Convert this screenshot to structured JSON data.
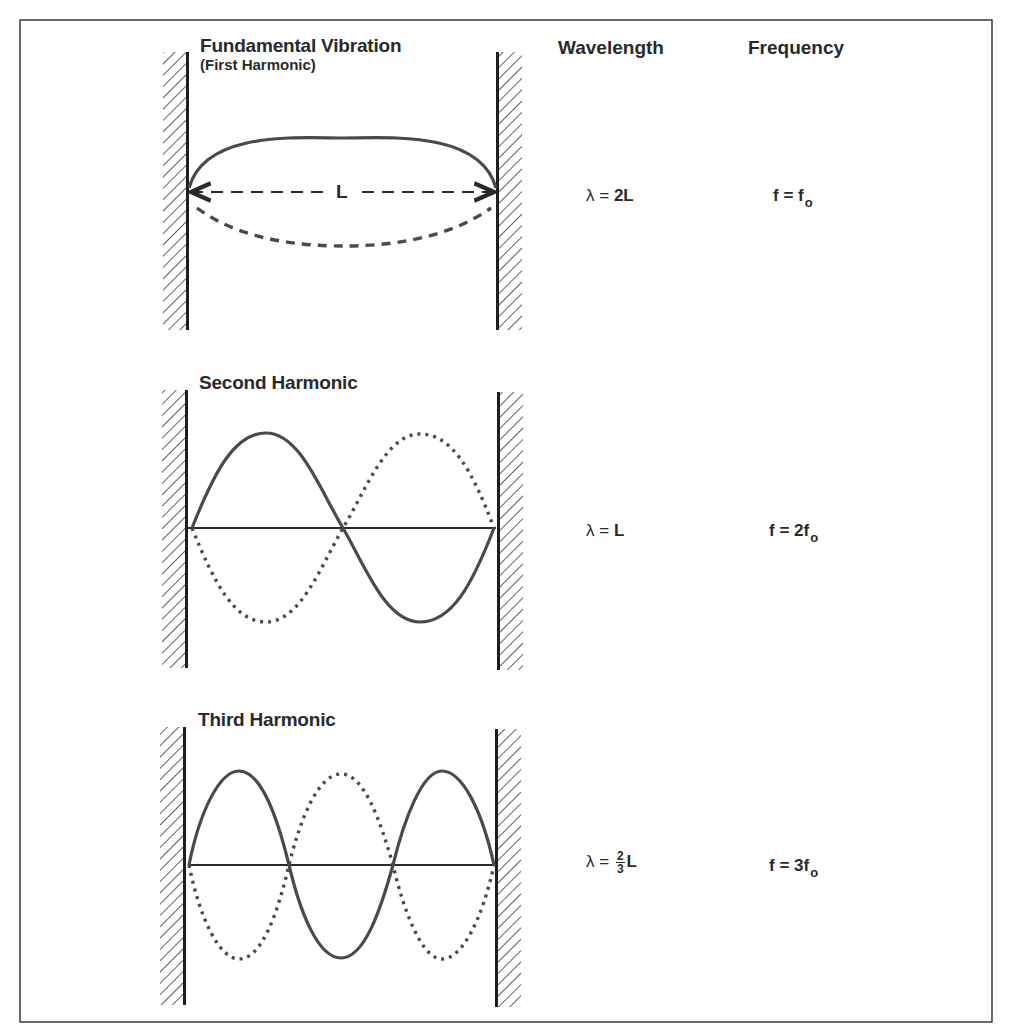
{
  "figure": {
    "columns": {
      "wavelength_header": "Wavelength",
      "frequency_header": "Frequency"
    },
    "panels": [
      {
        "title": "Fundamental Vibration",
        "subtitle": "(First Harmonic)",
        "length_label": "L",
        "wavelength_lhs": "λ = ",
        "wavelength_rhs": "2L",
        "frequency_lhs": "f = f",
        "frequency_sub": "o",
        "harmonic_number": 1,
        "solid_style": "solid",
        "mirror_style": "dashed"
      },
      {
        "title": "Second Harmonic",
        "wavelength_lhs": "λ = ",
        "wavelength_rhs": "L",
        "frequency_lhs": "f = 2f",
        "frequency_sub": "o",
        "harmonic_number": 2,
        "solid_style": "solid",
        "mirror_style": "dotted"
      },
      {
        "title": "Third Harmonic",
        "wavelength_lhs": "λ = ",
        "wavelength_frac_num": "2",
        "wavelength_frac_den": "3",
        "wavelength_rhs": "L",
        "frequency_lhs": "f = 3f",
        "frequency_sub": "o",
        "harmonic_number": 3,
        "solid_style": "solid",
        "mirror_style": "dotted"
      }
    ],
    "colors": {
      "ink": "#2a2a2a",
      "wave": "#4a4a4a",
      "background": "#ffffff"
    }
  }
}
